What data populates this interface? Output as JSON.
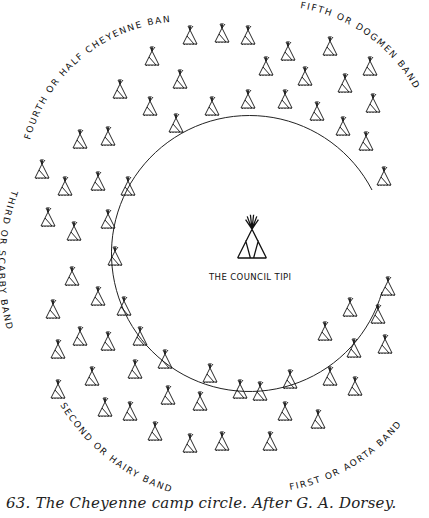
{
  "figure": {
    "caption": "63. The Cheyenne camp circle. After G. A. Dorsey.",
    "council_tipi_label": "THE COUNCIL TIPI",
    "bands": [
      {
        "id": "fourth",
        "label": "FOURTH OR HALF CHEYENNE BAND"
      },
      {
        "id": "fifth",
        "label": "FIFTH OR DOGMEN BAND"
      },
      {
        "id": "third",
        "label": "THIRD OR SCABBY BAND"
      },
      {
        "id": "second",
        "label": "SECOND OR HAIRY BAND"
      },
      {
        "id": "first",
        "label": "FIRST OR AORTA BAND"
      }
    ],
    "camp_circle": {
      "center": [
        252,
        260
      ],
      "radius": 138,
      "opening": "east"
    },
    "colors": {
      "ink": "#111111",
      "background": "#ffffff"
    }
  }
}
